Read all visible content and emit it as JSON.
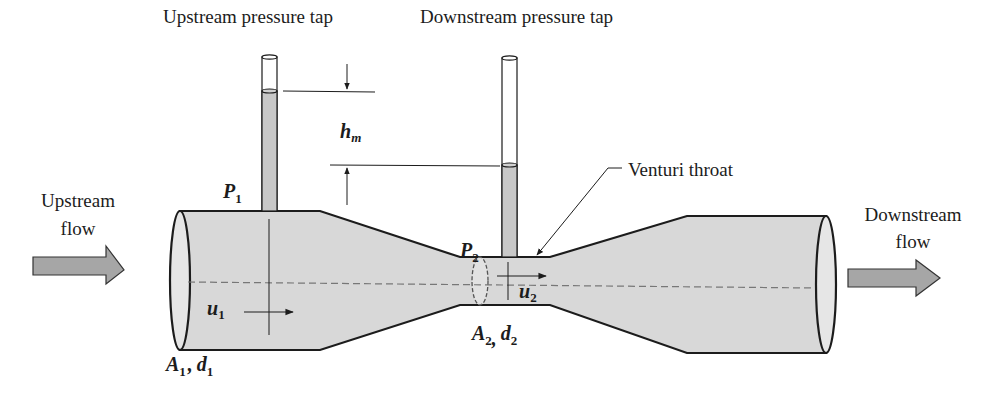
{
  "diagram": {
    "type": "venturi-meter-schematic",
    "labels": {
      "upstream_tap": "Upstream pressure tap",
      "downstream_tap": "Downstream pressure tap",
      "venturi_throat": "Venturi throat",
      "upstream_flow_line1": "Upstream",
      "upstream_flow_line2": "flow",
      "downstream_flow_line1": "Downstream",
      "downstream_flow_line2": "flow"
    },
    "symbols": {
      "p1": {
        "base": "P",
        "sub": "1"
      },
      "p2": {
        "base": "P",
        "sub": "2"
      },
      "hm": {
        "base": "h",
        "sub": "m"
      },
      "u1": {
        "base": "u",
        "sub": "1"
      },
      "u2": {
        "base": "u",
        "sub": "2"
      },
      "a1": {
        "base": "A",
        "sub": "1"
      },
      "d1": {
        "base": "d",
        "sub": "1"
      },
      "a2": {
        "base": "A",
        "sub": "2"
      },
      "d2": {
        "base": "d",
        "sub": "2"
      },
      "comma": ","
    },
    "colors": {
      "pipe_fill": "#d8d8d8",
      "fluid_fill": "#c8c8c8",
      "arrow_fill": "#a6a6a6",
      "outline": "#1c1c1c",
      "centerline": "#777777"
    }
  }
}
